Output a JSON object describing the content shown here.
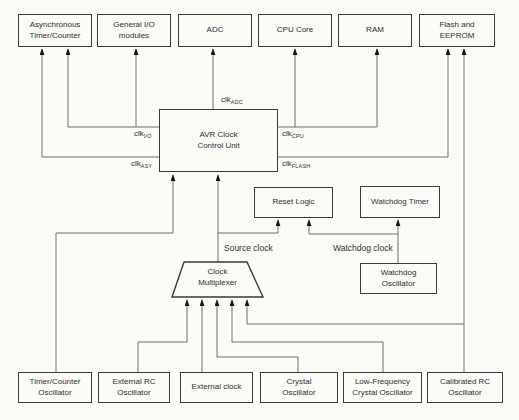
{
  "colors": {
    "background": "#fbfbf8",
    "line": "#6e6e6e",
    "border": "#3a3a3a",
    "text": "#2e2e2e",
    "arrow": "#141414"
  },
  "boxes": {
    "top_row": [
      "Asynchronous\nTimer/Counter",
      "General I/O\nmodules",
      "ADC",
      "CPU Core",
      "RAM",
      "Flash and\nEEPROM"
    ],
    "control_unit": "AVR Clock\nControl Unit",
    "reset_logic": "Reset Logic",
    "watchdog_timer": "Watchdog Timer",
    "watchdog_oscillator": "Watchdog\nOscillator",
    "clock_multiplexer": "Clock\nMultiplexer",
    "bottom_row": [
      "Timer/Counter\nOscillator",
      "External RC\nOscillator",
      "External clock",
      "Crystal\nOscillator",
      "Low-Frequency\nCrystal Oscillator",
      "Calibrated RC\nOscillator"
    ]
  },
  "clock_signals": {
    "adc": {
      "main": "clk",
      "sub": "ADC"
    },
    "io": {
      "main": "clk",
      "sub": "I/O"
    },
    "asy": {
      "main": "clk",
      "sub": "ASY"
    },
    "cpu": {
      "main": "clk",
      "sub": "CPU"
    },
    "flash": {
      "main": "clk",
      "sub": "FLASH"
    }
  },
  "annotations": {
    "source_clock": "Source clock",
    "watchdog_clock": "Watchdog clock"
  }
}
